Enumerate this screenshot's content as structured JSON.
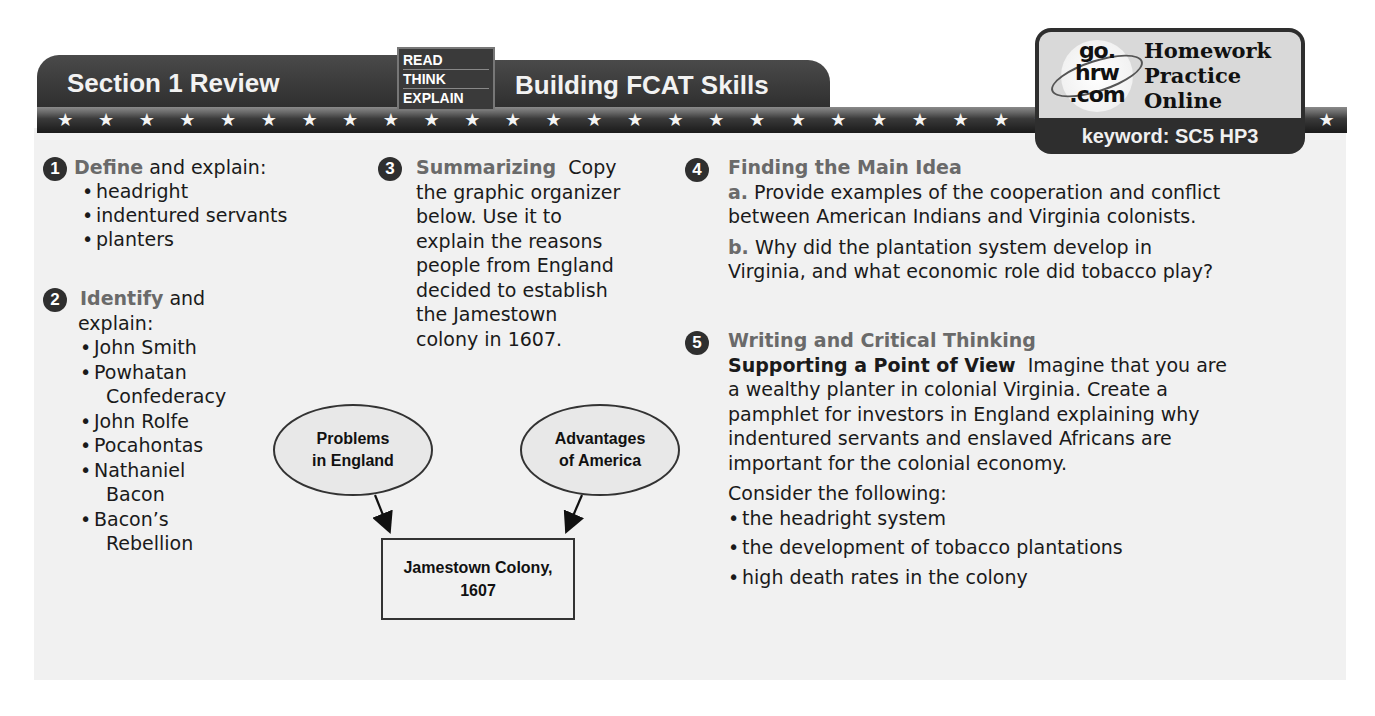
{
  "header": {
    "section_title": "Section 1 Review",
    "read_think_explain": [
      "READ",
      "THINK",
      "EXPLAIN"
    ],
    "skills_title": "Building FCAT Skills",
    "star_count": 32
  },
  "badge": {
    "logo_lines": [
      "go.",
      "hrw",
      ".com"
    ],
    "title_lines": [
      "Homework",
      "Practice",
      "Online"
    ],
    "keyword": "keyword: SC5 HP3"
  },
  "q1": {
    "number": "1",
    "heading": "Define",
    "rest": " and explain:",
    "items": [
      "headright",
      "indentured servants",
      "planters"
    ]
  },
  "q2": {
    "number": "2",
    "heading": "Identify",
    "rest": " and",
    "rest2": "explain:",
    "items": [
      "John Smith",
      "Powhatan Confederacy",
      "John Rolfe",
      "Pocahontas",
      "Nathaniel Bacon",
      "Bacon’s Rebellion"
    ],
    "item_lines": [
      [
        "John Smith"
      ],
      [
        "Powhatan",
        "Confederacy"
      ],
      [
        "John Rolfe"
      ],
      [
        "Pocahontas"
      ],
      [
        "Nathaniel",
        "Bacon"
      ],
      [
        "Bacon’s",
        "Rebellion"
      ]
    ]
  },
  "q3": {
    "number": "3",
    "heading": "Summarizing",
    "lines": [
      "Copy",
      "the graphic organizer",
      "below. Use it to",
      "explain the reasons",
      "people from England",
      "decided to establish",
      "the Jamestown",
      "colony in 1607."
    ]
  },
  "diagram": {
    "oval_left": [
      "Problems",
      "in England"
    ],
    "oval_right": [
      "Advantages",
      "of America"
    ],
    "box": [
      "Jamestown Colony,",
      "1607"
    ]
  },
  "q4": {
    "number": "4",
    "heading": "Finding the Main Idea",
    "a_label": "a.",
    "a_lines": [
      "Provide examples of the cooperation and conflict",
      "between American Indians and Virginia colonists."
    ],
    "b_label": "b.",
    "b_lines": [
      "Why did the plantation system develop in",
      "Virginia, and what economic role did tobacco play?"
    ]
  },
  "q5": {
    "number": "5",
    "heading": "Writing and Critical Thinking",
    "subheading": "Supporting a Point of View",
    "first_line_rest": "Imagine that you are",
    "lines": [
      "a wealthy planter in colonial Virginia. Create a",
      "pamphlet for investors in England explaining why",
      "indentured servants and enslaved Africans are",
      "important for the colonial economy."
    ],
    "consider": "Consider the following:",
    "items": [
      "the headright system",
      "the development of tobacco plantations",
      "high death rates in the colony"
    ]
  }
}
